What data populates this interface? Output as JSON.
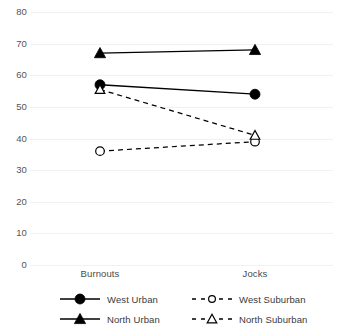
{
  "chart_data": {
    "type": "line",
    "title": "",
    "subtitle": "",
    "xlabel": "",
    "ylabel": "",
    "categories": [
      "Burnouts",
      "Jocks"
    ],
    "ylim": [
      0,
      80
    ],
    "yticks": [
      0,
      10,
      20,
      30,
      40,
      50,
      60,
      70,
      80
    ],
    "ytick_labels": [
      "0",
      "10",
      "20",
      "30",
      "40",
      "50",
      "60",
      "70",
      "80"
    ],
    "grid": true,
    "legend_position": "bottom",
    "series": [
      {
        "name": "West Urban",
        "values": [
          57,
          54
        ],
        "marker": "filled-circle",
        "line_style": "solid",
        "color": "#000000"
      },
      {
        "name": "North Urban",
        "values": [
          67,
          68
        ],
        "marker": "filled-triangle",
        "line_style": "solid",
        "color": "#000000"
      },
      {
        "name": "West Suburban",
        "values": [
          36,
          39
        ],
        "marker": "open-circle",
        "line_style": "dashed",
        "color": "#000000"
      },
      {
        "name": "North Suburban",
        "values": [
          55.5,
          41
        ],
        "marker": "open-triangle",
        "line_style": "dashed",
        "color": "#000000"
      }
    ]
  },
  "legend": {
    "entries": [
      {
        "label": "West Urban"
      },
      {
        "label": "West Suburban"
      },
      {
        "label": "North Urban"
      },
      {
        "label": "North Suburban"
      }
    ]
  }
}
